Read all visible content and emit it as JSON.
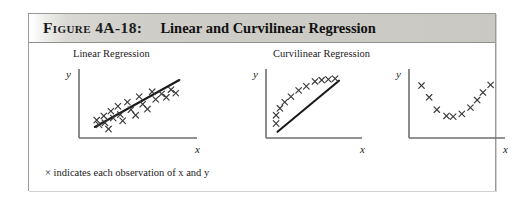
{
  "figure": {
    "header": {
      "label": "Figure",
      "number": "4A-18:",
      "title": "Linear and Curvilinear Regression",
      "band_color": "#cecdc8",
      "text_color": "#1c1c1c"
    },
    "caption": "× indicates each observation of x and y",
    "marker_symbol": "×",
    "axis_color": "#6e6e6e",
    "marker_color": "#3a3a3a",
    "line_color": "#1a1a1a"
  },
  "chart_data": [
    {
      "type": "scatter",
      "title": "Linear Regression",
      "xlabel": "x",
      "ylabel": "y",
      "xlim": [
        0,
        10
      ],
      "ylim": [
        0,
        10
      ],
      "grid": false,
      "legend": "none",
      "marker": "x",
      "fit_line": {
        "shown": true,
        "kind": "linear",
        "x": [
          1.35,
          8.5
        ],
        "y": [
          1.6,
          8.4
        ]
      },
      "points": [
        {
          "x": 1.5,
          "y": 2.6
        },
        {
          "x": 1.7,
          "y": 1.9
        },
        {
          "x": 2.1,
          "y": 3.2
        },
        {
          "x": 2.2,
          "y": 2.2
        },
        {
          "x": 2.5,
          "y": 1.3
        },
        {
          "x": 2.7,
          "y": 3.9
        },
        {
          "x": 2.9,
          "y": 2.9
        },
        {
          "x": 3.3,
          "y": 4.6
        },
        {
          "x": 3.5,
          "y": 3.4
        },
        {
          "x": 3.7,
          "y": 2.5
        },
        {
          "x": 4.1,
          "y": 5.2
        },
        {
          "x": 4.4,
          "y": 4.1
        },
        {
          "x": 4.8,
          "y": 3.3
        },
        {
          "x": 5.1,
          "y": 6.0
        },
        {
          "x": 5.4,
          "y": 4.9
        },
        {
          "x": 5.8,
          "y": 4.2
        },
        {
          "x": 6.2,
          "y": 6.7
        },
        {
          "x": 6.5,
          "y": 5.6
        },
        {
          "x": 7.0,
          "y": 6.4
        },
        {
          "x": 7.4,
          "y": 5.9
        },
        {
          "x": 7.8,
          "y": 7.0
        },
        {
          "x": 8.2,
          "y": 6.5
        }
      ]
    },
    {
      "type": "scatter",
      "title": "Curvilinear Regression",
      "xlabel": "x",
      "ylabel": "y",
      "xlim": [
        0,
        10
      ],
      "ylim": [
        0,
        10
      ],
      "grid": false,
      "legend": "none",
      "marker": "x",
      "fit_line": {
        "shown": true,
        "kind": "linear",
        "x": [
          1.2,
          7.6
        ],
        "y": [
          0.9,
          8.3
        ]
      },
      "points": [
        {
          "x": 1.05,
          "y": 2.1
        },
        {
          "x": 1.05,
          "y": 3.3
        },
        {
          "x": 1.45,
          "y": 4.3
        },
        {
          "x": 1.95,
          "y": 5.2
        },
        {
          "x": 2.6,
          "y": 6.0
        },
        {
          "x": 3.4,
          "y": 6.9
        },
        {
          "x": 4.2,
          "y": 7.5
        },
        {
          "x": 5.1,
          "y": 8.2
        },
        {
          "x": 5.8,
          "y": 8.4
        },
        {
          "x": 6.5,
          "y": 8.5
        },
        {
          "x": 7.2,
          "y": 8.6
        }
      ]
    },
    {
      "type": "scatter",
      "title": "Curvilinear Regression",
      "xlabel": "x",
      "ylabel": "y",
      "xlim": [
        0,
        10
      ],
      "ylim": [
        0,
        10
      ],
      "grid": false,
      "legend": "none",
      "marker": "x",
      "fit_line": {
        "shown": false
      },
      "points": [
        {
          "x": 1.3,
          "y": 7.6
        },
        {
          "x": 2.1,
          "y": 5.9
        },
        {
          "x": 2.9,
          "y": 4.1
        },
        {
          "x": 3.9,
          "y": 3.2
        },
        {
          "x": 4.6,
          "y": 3.1
        },
        {
          "x": 5.5,
          "y": 3.5
        },
        {
          "x": 6.4,
          "y": 4.4
        },
        {
          "x": 7.1,
          "y": 5.5
        },
        {
          "x": 7.7,
          "y": 6.6
        },
        {
          "x": 8.5,
          "y": 7.7
        }
      ]
    }
  ]
}
